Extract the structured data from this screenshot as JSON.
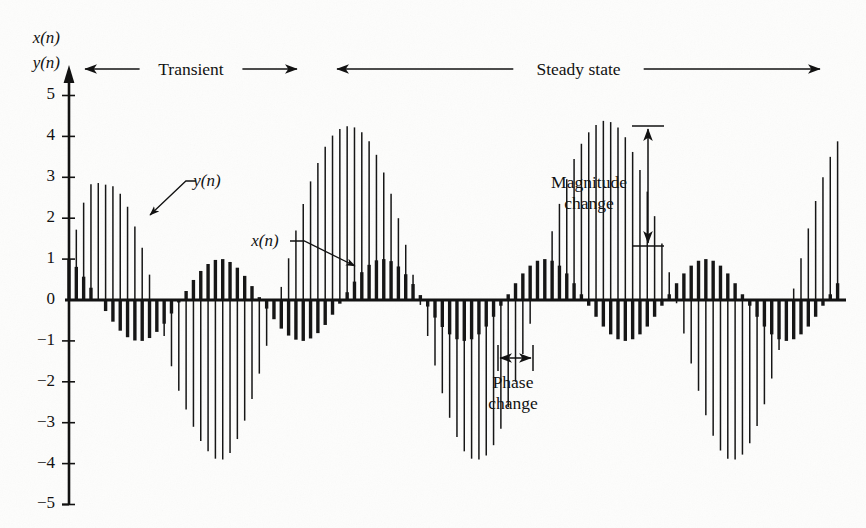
{
  "figure": {
    "axis": {
      "y_label_line1": "x(n)",
      "y_label_line2": "y(n)",
      "y_ticks": [
        "5",
        "4",
        "3",
        "2",
        "1",
        "0",
        "−1",
        "−2",
        "−3",
        "−4",
        "−5"
      ],
      "y_tick_values": [
        5,
        4,
        3,
        2,
        1,
        0,
        -1,
        -2,
        -3,
        -4,
        -5
      ],
      "ymin": -5,
      "ymax": 5.6,
      "grid": false
    },
    "regions": [
      {
        "name": "transient",
        "label": "Transient",
        "x_start_px": 85,
        "x_end_px": 297
      },
      {
        "name": "steady-state",
        "label": "Steady state",
        "x_start_px": 337,
        "x_end_px": 820
      }
    ],
    "series_labels": [
      {
        "name": "y-series-label",
        "text": "y(n)",
        "label_x": 207,
        "label_y": 186,
        "leader_from_x": 196,
        "leader_from_y": 181,
        "arrow_to_x": 150,
        "arrow_to_y": 215
      },
      {
        "name": "x-series-label",
        "text": "x(n)",
        "label_x": 265,
        "label_y": 246,
        "leader_from_x": 290,
        "leader_from_y": 241,
        "arrow_to_x": 355,
        "arrow_to_y": 266
      }
    ],
    "annotations": [
      {
        "name": "magnitude-change",
        "label_line1": "Magnitude",
        "label_line2": "change",
        "label_x": 589,
        "label_y": 188,
        "arrow_x": 648,
        "arrow_top_y": 126,
        "arrow_bottom_y": 246,
        "cap_half_width": 16,
        "orientation": "vertical"
      },
      {
        "name": "phase-change",
        "label_line1": "Phase",
        "label_line2": "change",
        "label_x": 513,
        "label_y": 388,
        "arrow_y": 358,
        "arrow_left_x": 498,
        "arrow_right_x": 533,
        "cap_half_height": 13,
        "orientation": "horizontal"
      }
    ],
    "colors": {
      "ink": "#121212",
      "paper": "#fdfdfc"
    }
  },
  "chart_data": {
    "type": "line",
    "title": "",
    "subtitle": "",
    "xlabel": "",
    "ylabel": "x(n), y(n)",
    "ylim": [
      -5,
      5.6
    ],
    "grid": false,
    "legend_position": "inline-annotation",
    "plot_geometry": {
      "origin_x_px": 69,
      "origin_y_px": 300,
      "sample_spacing_px": 7.32,
      "unit_px": 40.9,
      "x_axis_end_px": 846,
      "n_samples": 106
    },
    "series": [
      {
        "name": "x(n)",
        "style": "stem-thick",
        "stroke_width": 3.4,
        "description": "Input sinusoid, constant amplitude 1",
        "values": [
          1.0,
          0.81,
          0.57,
          0.3,
          0.02,
          -0.27,
          -0.53,
          -0.75,
          -0.91,
          -0.99,
          -1.0,
          -0.93,
          -0.78,
          -0.58,
          -0.33,
          -0.06,
          0.22,
          0.49,
          0.71,
          0.88,
          0.98,
          1.0,
          0.93,
          0.79,
          0.59,
          0.34,
          0.07,
          -0.21,
          -0.47,
          -0.7,
          -0.87,
          -0.97,
          -1.0,
          -0.94,
          -0.81,
          -0.61,
          -0.36,
          -0.09,
          0.19,
          0.45,
          0.68,
          0.86,
          0.97,
          1.0,
          0.95,
          0.82,
          0.63,
          0.39,
          0.12,
          -0.16,
          -0.43,
          -0.66,
          -0.84,
          -0.96,
          -1.0,
          -0.96,
          -0.84,
          -0.65,
          -0.41,
          -0.14,
          0.14,
          0.41,
          0.65,
          0.84,
          0.96,
          1.0,
          0.96,
          0.84,
          0.65,
          0.41,
          0.14,
          -0.14,
          -0.41,
          -0.65,
          -0.84,
          -0.96,
          -1.0,
          -0.96,
          -0.84,
          -0.65,
          -0.41,
          -0.14,
          0.14,
          0.41,
          0.65,
          0.84,
          0.96,
          1.0,
          0.96,
          0.84,
          0.65,
          0.41,
          0.14,
          -0.14,
          -0.41,
          -0.65,
          -0.84,
          -0.96,
          -1.0,
          -0.96,
          -0.84,
          -0.65,
          -0.41,
          -0.14,
          0.14,
          0.41
        ]
      },
      {
        "name": "y(n)",
        "style": "stem-thin",
        "stroke_width": 1.5,
        "description": "Filter output: transient build-up then steady state with amplitude ~4.2 and phase lag",
        "values": [
          0.95,
          1.72,
          2.38,
          2.83,
          2.86,
          2.82,
          2.78,
          2.6,
          2.28,
          1.8,
          1.28,
          0.62,
          -0.1,
          -0.88,
          -1.62,
          -2.22,
          -2.68,
          -3.1,
          -3.45,
          -3.7,
          -3.88,
          -3.9,
          -3.74,
          -3.4,
          -2.95,
          -2.42,
          -1.8,
          -1.12,
          -0.4,
          0.32,
          1.02,
          1.7,
          2.35,
          2.9,
          3.35,
          3.75,
          4.02,
          4.18,
          4.25,
          4.22,
          4.1,
          3.88,
          3.55,
          3.12,
          2.6,
          2.0,
          1.35,
          0.62,
          -0.12,
          -0.88,
          -1.6,
          -2.28,
          -2.88,
          -3.35,
          -3.7,
          -3.88,
          -3.9,
          -3.8,
          -3.55,
          -3.15,
          -2.62,
          -2.0,
          -1.32,
          -0.58,
          0.18,
          0.95,
          1.68,
          2.35,
          2.95,
          3.45,
          3.82,
          4.1,
          4.28,
          4.38,
          4.35,
          4.22,
          3.98,
          3.62,
          3.18,
          2.65,
          2.05,
          1.38,
          0.68,
          -0.08,
          -0.82,
          -1.55,
          -2.22,
          -2.82,
          -3.32,
          -3.68,
          -3.88,
          -3.9,
          -3.78,
          -3.5,
          -3.08,
          -2.55,
          -1.92,
          -1.22,
          -0.48,
          0.28,
          1.02,
          1.75,
          2.42,
          3.0,
          3.5,
          3.88
        ]
      }
    ],
    "annotations_text": [
      "Transient",
      "Steady state",
      "Magnitude change",
      "Phase change",
      "x(n)",
      "y(n)"
    ]
  }
}
